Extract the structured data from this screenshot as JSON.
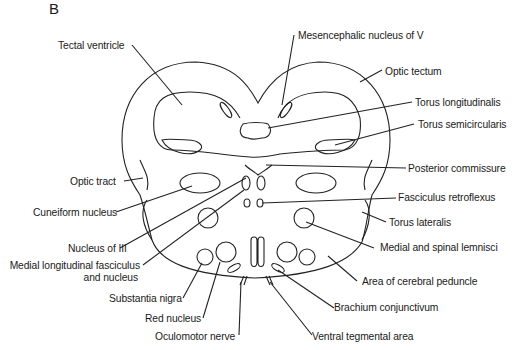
{
  "panel_label": "B",
  "labels": {
    "tectal_ventricle": "Tectal ventricle",
    "mesencephalic_nucleus_v": "Mesencephalic nucleus of V",
    "optic_tectum": "Optic tectum",
    "torus_longitudinalis": "Torus longitudinalis",
    "torus_semicircularis": "Torus semicircularis",
    "posterior_commissure": "Posterior commissure",
    "optic_tract": "Optic tract",
    "fasciculus_retroflexus": "Fasciculus retroflexus",
    "cuneiform_nucleus": "Cuneiform nucleus",
    "torus_lateralis": "Torus lateralis",
    "nucleus_of_iii": "Nucleus of III",
    "medial_spinal_lemnisci": "Medial and spinal lemnisci",
    "mlf_line1": "Medial longitudinal fasciculus",
    "mlf_line2": "and nucleus",
    "area_cerebral_peduncle": "Area of cerebral peduncle",
    "substantia_nigra": "Substantia nigra",
    "brachium_conjunctivum": "Brachium conjunctivum",
    "red_nucleus": "Red nucleus",
    "oculomotor_nerve": "Oculomotor nerve",
    "ventral_tegmental_area": "Ventral tegmental area"
  }
}
